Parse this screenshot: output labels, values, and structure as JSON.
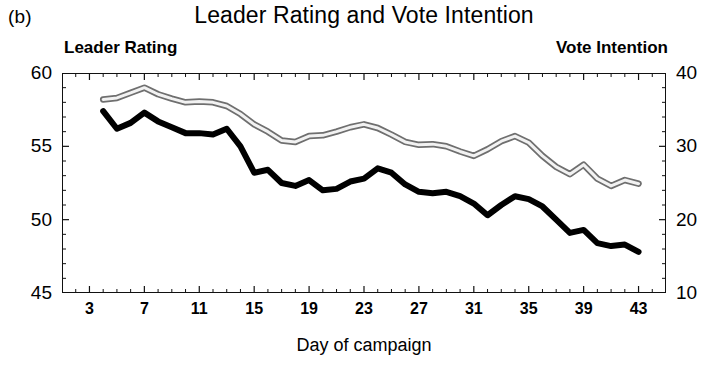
{
  "panel": {
    "label": "(b)"
  },
  "header": {
    "title": "Leader Rating and Vote Intention",
    "left_series_name": "Leader Rating",
    "right_series_name": "Vote Intention"
  },
  "axes": {
    "xlabel": "Day of campaign",
    "x_ticks": [
      3,
      7,
      11,
      15,
      19,
      23,
      27,
      31,
      35,
      39,
      43
    ],
    "x_range": [
      1,
      45
    ],
    "x_minor_step": 1,
    "left_ticks": [
      45,
      50,
      55,
      60
    ],
    "left_range": [
      45,
      60
    ],
    "right_ticks": [
      10,
      20,
      30,
      40
    ],
    "right_range": [
      10,
      40
    ]
  },
  "style": {
    "leader_color": "#000000",
    "vote_color": "#a8a8a8",
    "frame_color": "#111111",
    "background": "#ffffff"
  },
  "chart_data": {
    "type": "line",
    "title": "Leader Rating and Vote Intention",
    "xlabel": "Day of campaign",
    "ylabel": "Leader Rating",
    "y2label": "Vote Intention",
    "grid": false,
    "legend": "axis-labels",
    "xlim": [
      1,
      45
    ],
    "ylim": [
      45,
      60
    ],
    "y2lim": [
      10,
      40
    ],
    "x": [
      4,
      5,
      6,
      7,
      8,
      9,
      10,
      11,
      12,
      13,
      14,
      15,
      16,
      17,
      18,
      19,
      20,
      21,
      22,
      23,
      24,
      25,
      26,
      27,
      28,
      29,
      30,
      31,
      32,
      33,
      34,
      35,
      36,
      37,
      38,
      39,
      40,
      41,
      42,
      43
    ],
    "series": [
      {
        "name": "Leader Rating",
        "axis": "left",
        "color": "#000000",
        "values": [
          57.4,
          56.2,
          56.6,
          57.3,
          56.7,
          56.3,
          55.9,
          55.9,
          55.8,
          56.2,
          55.0,
          53.2,
          53.4,
          52.5,
          52.3,
          52.7,
          52.0,
          52.1,
          52.6,
          52.8,
          53.5,
          53.2,
          52.4,
          51.9,
          51.8,
          51.9,
          51.6,
          51.1,
          50.3,
          51.0,
          51.6,
          51.4,
          50.9,
          50.0,
          49.1,
          49.3,
          48.4,
          48.2,
          48.3,
          47.8
        ]
      },
      {
        "name": "Vote Intention",
        "axis": "right",
        "color": "#a8a8a8",
        "values": [
          36.4,
          36.6,
          37.3,
          38.0,
          37.1,
          36.5,
          36.0,
          36.1,
          36.0,
          35.5,
          34.4,
          33.0,
          32.0,
          30.8,
          30.6,
          31.4,
          31.5,
          32.0,
          32.6,
          33.0,
          32.5,
          31.6,
          30.6,
          30.2,
          30.3,
          30.0,
          29.3,
          28.7,
          29.6,
          30.7,
          31.4,
          30.5,
          28.7,
          27.2,
          26.2,
          27.5,
          25.6,
          24.6,
          25.4,
          24.9
        ]
      }
    ]
  }
}
